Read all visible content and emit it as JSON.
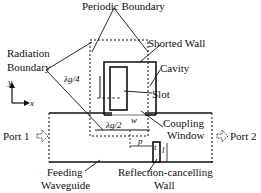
{
  "labels": {
    "periodic_boundary": "Periodic Boundary",
    "radiation_boundary_line1": "Radiation",
    "radiation_boundary_line2": "Boundary",
    "shorted_wall": "Shorted Wall",
    "cavity": "Cavity",
    "slot": "Slot",
    "coupling_window_line1": "Coupling",
    "coupling_window_line2": "Window",
    "port1": "Port 1",
    "port2": "Port 2",
    "feeding_waveguide_line1": "Feeding",
    "feeding_waveguide_line2": "Waveguide",
    "reflection_wall_line1": "Reflection-cancelling",
    "reflection_wall_line2": "Wall",
    "lambda_quarter": "λg/4",
    "lambda_half": "λg/2",
    "dim_w": "w",
    "dim_p": "p",
    "dim_l": "l",
    "dim_t": "t",
    "axis_x": "x",
    "axis_y": "y"
  },
  "colors": {
    "line": "#111111",
    "background": "#ffffff"
  }
}
